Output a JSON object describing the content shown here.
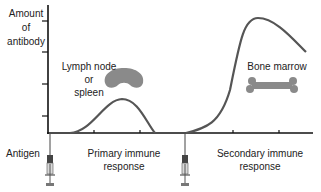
{
  "diagram": {
    "y_axis_label": [
      "Amount",
      "of",
      "antibody"
    ],
    "antigen_label": "Antigen",
    "primary_label": [
      "Primary immune",
      "response"
    ],
    "secondary_label": [
      "Secondary immune",
      "response"
    ],
    "lymph_label": [
      "Lymph node",
      "or",
      "spleen"
    ],
    "bone_label": "Bone marrow",
    "colors": {
      "axis": "#111111",
      "curve": "#555555",
      "organ": "#8a8a8a",
      "syringe_dark": "#444444",
      "syringe_body": "#cccccc"
    },
    "curves": {
      "primary": {
        "start_time": 0.13,
        "peak_time": 0.28,
        "end_time": 0.41,
        "peak_level": 0.27
      },
      "secondary": {
        "start_time": 0.52,
        "peak_time": 0.79,
        "end_time": 0.97,
        "peak_level": 0.9,
        "end_level": 0.64
      }
    },
    "injections": [
      "first-antigen-dose",
      "second-antigen-dose"
    ]
  }
}
